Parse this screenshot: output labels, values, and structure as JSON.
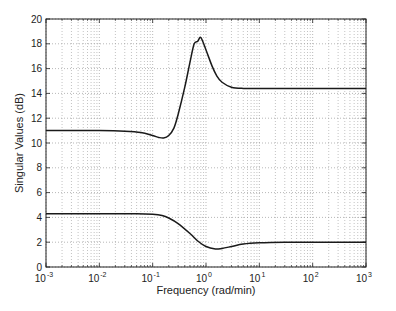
{
  "chart_data": {
    "type": "line",
    "title": "",
    "xlabel": "Frequency (rad/min)",
    "ylabel": "Singular Values (dB)",
    "xscale": "log",
    "xlim": [
      0.001,
      1000
    ],
    "ylim": [
      0,
      20
    ],
    "grid": true,
    "legend": null,
    "x_tick_labels": [
      "10^-3",
      "10^-2",
      "10^-1",
      "10^0",
      "10^1",
      "10^2",
      "10^3"
    ],
    "x_tick_exponents": [
      -3,
      -2,
      -1,
      0,
      1,
      2,
      3
    ],
    "y_ticks": [
      0,
      2,
      4,
      6,
      8,
      10,
      12,
      14,
      16,
      18,
      20
    ],
    "series": [
      {
        "name": "sigma_max",
        "x": [
          0.001,
          0.003,
          0.01,
          0.03,
          0.06,
          0.1,
          0.13,
          0.16,
          0.2,
          0.25,
          0.3,
          0.4,
          0.5,
          0.6,
          0.7,
          0.8,
          1.0,
          1.3,
          1.6,
          2.0,
          3.0,
          5.0,
          10,
          100,
          1000
        ],
        "y": [
          11.0,
          11.0,
          11.0,
          10.95,
          10.85,
          10.6,
          10.45,
          10.4,
          10.6,
          11.2,
          12.3,
          14.5,
          16.5,
          18.0,
          18.2,
          18.5,
          17.5,
          16.2,
          15.4,
          14.9,
          14.5,
          14.4,
          14.4,
          14.4,
          14.4
        ]
      },
      {
        "name": "sigma_min",
        "x": [
          0.001,
          0.01,
          0.05,
          0.1,
          0.15,
          0.2,
          0.3,
          0.5,
          0.7,
          1.0,
          1.5,
          2.0,
          3.0,
          5.0,
          10,
          30,
          100,
          1000
        ],
        "y": [
          4.3,
          4.3,
          4.3,
          4.25,
          4.15,
          3.95,
          3.5,
          2.7,
          2.1,
          1.65,
          1.45,
          1.5,
          1.65,
          1.85,
          1.95,
          2.0,
          2.0,
          2.0
        ]
      }
    ],
    "colors": {
      "line": "#1a1a1a",
      "grid": "#9a9a9a",
      "axis": "#222222"
    }
  }
}
